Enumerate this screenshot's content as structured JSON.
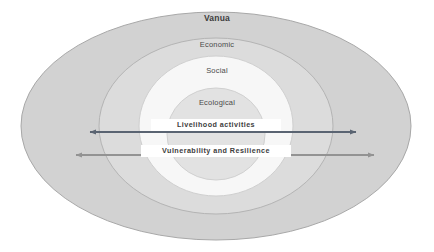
{
  "figure": {
    "type": "concentric-ellipse-diagram",
    "background_color": "#ffffff"
  },
  "rings": [
    {
      "id": "vanua",
      "label": "Vanua",
      "fill": "#d2d2d2",
      "stroke": "#a8a8a8",
      "emphasis": "bold",
      "order": 1
    },
    {
      "id": "economic",
      "label": "Economic",
      "fill": "#dcdcdc",
      "stroke": "#b4b4b4",
      "emphasis": "normal",
      "order": 2
    },
    {
      "id": "social",
      "label": "Social",
      "fill": "#f7f7f7",
      "stroke": "#cfcfcf",
      "emphasis": "normal",
      "order": 3
    },
    {
      "id": "ecological",
      "label": "Ecological",
      "fill": "#e2e2e2",
      "stroke": "#d0d0d0",
      "emphasis": "normal",
      "order": 4
    }
  ],
  "arrows": [
    {
      "id": "livelihood-activities",
      "label": "Livelihood activities",
      "color": "#5a6472",
      "direction": "double",
      "x_start": 90,
      "x_end": 356,
      "y": 132
    },
    {
      "id": "vulnerability-and-resilience",
      "label": "Vulnerability and Resilience",
      "color": "#939393",
      "direction": "double",
      "x_start": 76,
      "x_end": 374,
      "y": 155
    }
  ],
  "colors": {
    "text_primary": "#3d3d3d",
    "text_secondary": "#4a4a4a",
    "label_box_fill": "#ffffff"
  }
}
